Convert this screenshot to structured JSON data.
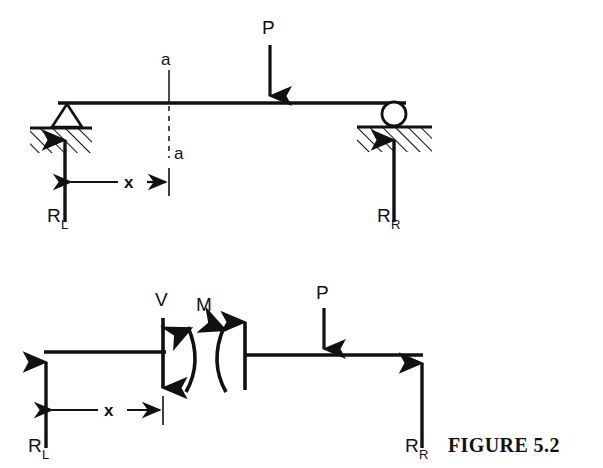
{
  "figure": {
    "caption": "FIGURE 5.2"
  },
  "diagram_top": {
    "name": "simply-supported-beam",
    "labels": {
      "load": "P",
      "section_top": "a",
      "section_bottom": "a",
      "dimension": "x",
      "reaction_left": "R",
      "reaction_left_sub": "L",
      "reaction_right": "R",
      "reaction_right_sub": "R"
    },
    "supports": {
      "left_type": "pin-triangle-on-hatched-ground",
      "right_type": "roller-circle-on-hatched-ground"
    }
  },
  "diagram_bottom": {
    "name": "free-body-diagram",
    "labels": {
      "shear": "V",
      "moment": "M",
      "load": "P",
      "dimension": "x",
      "reaction_left": "R",
      "reaction_left_sub": "L",
      "reaction_right": "R",
      "reaction_right_sub": "R"
    }
  },
  "colors": {
    "ink": "#111111",
    "background": "#ffffff"
  }
}
